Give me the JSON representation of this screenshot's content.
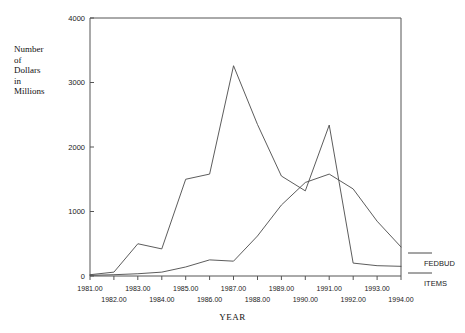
{
  "chart_data": {
    "type": "line",
    "title": "",
    "xlabel": "YEAR",
    "ylabel": "Number\nof\nDollars\nin\nMillions",
    "x": [
      1981,
      1982,
      1983,
      1984,
      1985,
      1986,
      1987,
      1988,
      1989,
      1990,
      1991,
      1992,
      1993,
      1994
    ],
    "xtick_labels": [
      "1981.00",
      "1982.00",
      "1983.00",
      "1984.00",
      "1985.00",
      "1986.00",
      "1987.00",
      "1988.00",
      "1989.00",
      "1990.00",
      "1991.00",
      "1992.00",
      "1993.00",
      "1994.00"
    ],
    "ytick_labels": [
      "0",
      "1000",
      "2000",
      "3000",
      "4000"
    ],
    "ytick_values": [
      0,
      1000,
      2000,
      3000,
      4000
    ],
    "xlim": [
      1981,
      1994
    ],
    "ylim": [
      0,
      4000
    ],
    "grid": false,
    "legend_position": "right",
    "series": [
      {
        "name": "FEDBUD",
        "values": [
          20,
          60,
          500,
          420,
          1500,
          1580,
          3260,
          2350,
          1550,
          1320,
          2340,
          200,
          160,
          150
        ]
      },
      {
        "name": "ITEMS",
        "values": [
          10,
          20,
          35,
          60,
          140,
          250,
          230,
          620,
          1100,
          1450,
          1580,
          1350,
          850,
          450
        ]
      }
    ],
    "legend": [
      "FEDBUD",
      "ITEMS"
    ]
  },
  "axis": {
    "y_caption_line1": "Number",
    "y_caption_line2": "of",
    "y_caption_line3": "Dollars",
    "y_caption_line4": "in",
    "y_caption_line5": "Millions",
    "x_caption": "YEAR"
  },
  "legend": {
    "item0_label": "FEDBUD",
    "item1_label": "ITEMS"
  },
  "yticks": {
    "t0": "0",
    "t1": "1000",
    "t2": "2000",
    "t3": "3000",
    "t4": "4000"
  },
  "xticks": {
    "t0": "1981.00",
    "t1": "1982.00",
    "t2": "1983.00",
    "t3": "1984.00",
    "t4": "1985.00",
    "t5": "1986.00",
    "t6": "1987.00",
    "t7": "1988.00",
    "t8": "1989.00",
    "t9": "1990.00",
    "t10": "1991.00",
    "t11": "1992.00",
    "t12": "1993.00",
    "t13": "1994.00"
  },
  "colors": {
    "line": "#4a4a4a",
    "axis": "#555555",
    "text": "#1a1a1a",
    "background": "#ffffff"
  }
}
